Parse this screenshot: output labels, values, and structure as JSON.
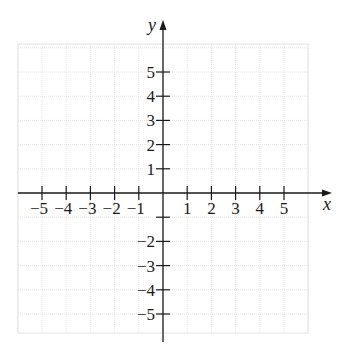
{
  "figure": {
    "type": "coordinate-plane",
    "x_axis": {
      "label": "x",
      "min": -6,
      "max": 6,
      "ticks": [
        -5,
        -4,
        -3,
        -2,
        -1,
        1,
        2,
        3,
        4,
        5
      ],
      "tick_labels": [
        "−5",
        "−4",
        "−3",
        "−2",
        "−1",
        "1",
        "2",
        "3",
        "4",
        "5"
      ]
    },
    "y_axis": {
      "label": "y",
      "min": -6,
      "max": 6,
      "ticks": [
        5,
        4,
        3,
        2,
        1,
        -1,
        -2,
        -3,
        -4,
        -5
      ],
      "tick_labels": [
        "5",
        "4",
        "3",
        "2",
        "1",
        "",
        "−2",
        "−3",
        "−4",
        "−5"
      ]
    },
    "grid": {
      "on": true,
      "step": 1,
      "color": "#e4e4e4"
    },
    "colors": {
      "axis": "#1a1a1a",
      "background": "#ffffff"
    }
  }
}
